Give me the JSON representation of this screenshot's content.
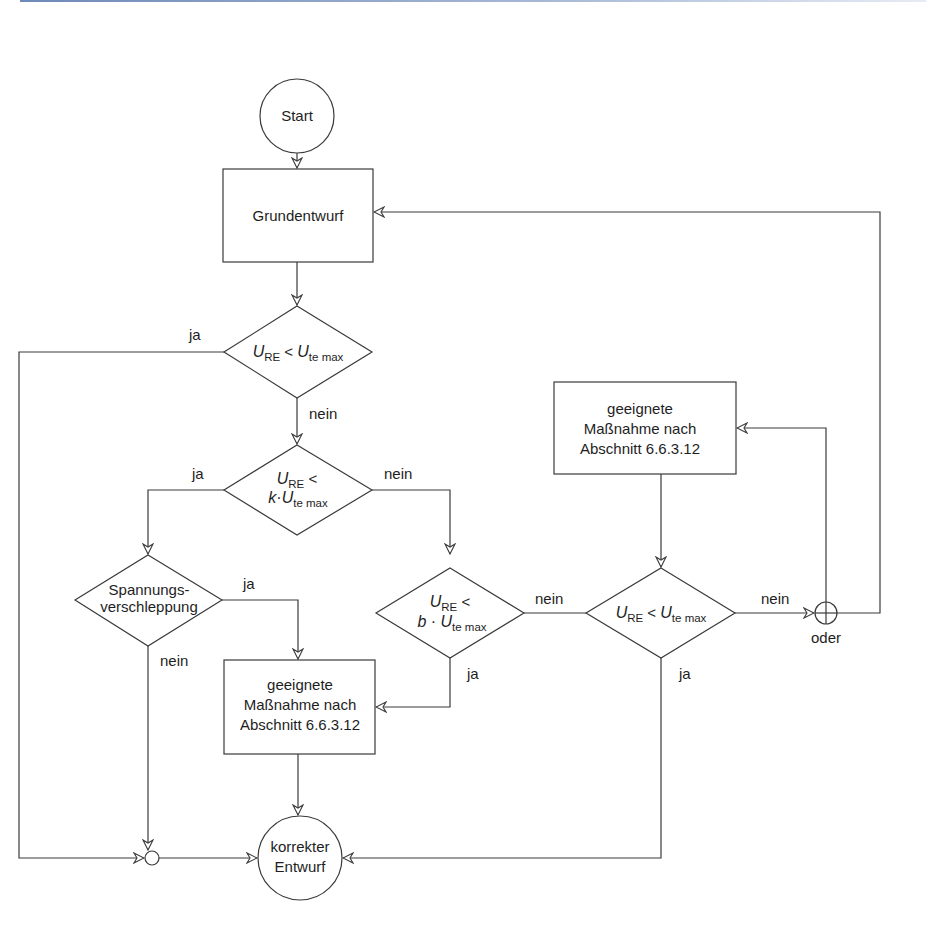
{
  "nodes": {
    "start": "Start",
    "grundentwurf": "Grundentwurf",
    "decision1": {
      "var": "U",
      "sub1": "RE",
      "op": " < ",
      "var2": "U",
      "sub2": "te max"
    },
    "decision2": {
      "line1_var": "U",
      "line1_sub": "RE",
      "line1_op": " <",
      "line2_factor": "k",
      "line2_dot": "·",
      "line2_var": "U",
      "line2_sub": "te max"
    },
    "spannung": {
      "line1": "Spannungs-",
      "line2": "verschleppung"
    },
    "decision_b": {
      "line1_var": "U",
      "line1_sub": "RE",
      "line1_op": " <",
      "line2_factor": "b",
      "line2_dot": " · ",
      "line2_var": "U",
      "line2_sub": "te max"
    },
    "decision_right": {
      "var": "U",
      "sub1": "RE",
      "op": " < ",
      "var2": "U",
      "sub2": "te max"
    },
    "massnahme_right": {
      "line1": "geeignete",
      "line2": "Maßnahme nach",
      "line3": "Abschnitt 6.6.3.12"
    },
    "massnahme_center": {
      "line1": "geeignete",
      "line2": "Maßnahme nach",
      "line3": "Abschnitt 6.6.3.12"
    },
    "oder": "oder",
    "end": {
      "line1": "korrekter",
      "line2": "Entwurf"
    }
  },
  "labels": {
    "d1_yes": "ja",
    "d1_no": "nein",
    "d2_yes": "ja",
    "d2_no": "nein",
    "span_yes": "ja",
    "span_no": "nein",
    "db_no": "nein",
    "db_yes": "ja",
    "dr_no": "nein",
    "dr_yes": "ja"
  },
  "colors": {
    "stroke": "#3a3a3a",
    "text": "#1e1e1e",
    "topbar": "#6f89b8"
  }
}
